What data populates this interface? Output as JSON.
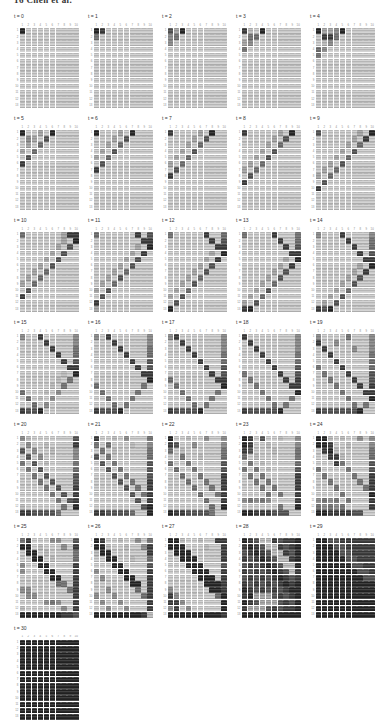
{
  "header": {
    "text": "16 Chen et al."
  },
  "figure": {
    "col_labels": [
      "1",
      "2",
      "3",
      "4",
      "5",
      "6",
      "7",
      "8",
      "9",
      "10"
    ],
    "row_labels": [
      "1",
      "2",
      "3",
      "4",
      "5",
      "6",
      "7",
      "8",
      "9",
      "10",
      "11",
      "12",
      "13"
    ],
    "colormap": {
      "low": "#d4d4d4",
      "high": "#202020"
    },
    "intensity_scale": "digits 0 (light gray, low value) to 9 (near black, high value)",
    "heatmaps": [
      {
        "label": "t = 0",
        "grid": [
          "9111111111",
          "1111111111",
          "1111111111",
          "1111111111",
          "1111111111",
          "1111111111",
          "1111111111",
          "1111111111",
          "1111111111",
          "1111111111",
          "1111111111",
          "1111111111",
          "1111111111"
        ]
      },
      {
        "label": "t = 1",
        "grid": [
          "9811111111",
          "5111111111",
          "1111111111",
          "1111111111",
          "1111111111",
          "1111111111",
          "1111111111",
          "1111111111",
          "1111111111",
          "1111111111",
          "1111111111",
          "1111111111",
          "1111111111"
        ]
      },
      {
        "label": "t = 2",
        "grid": [
          "7391111111",
          "4511111111",
          "4111111111",
          "1111111111",
          "1111111111",
          "1111111111",
          "1111111111",
          "1111111111",
          "1111111111",
          "1111111111",
          "1111111111",
          "1111111111",
          "1111111111"
        ]
      },
      {
        "label": "t = 3",
        "grid": [
          "8219111111",
          "1561111111",
          "3411111111",
          "5111111111",
          "1111111111",
          "1111111111",
          "1111111111",
          "1111111111",
          "1111111111",
          "1111111111",
          "1111111111",
          "1111111111",
          "1111111111"
        ]
      },
      {
        "label": "t = 4",
        "grid": [
          "9334911111",
          "1885111111",
          "1241111111",
          "6411111111",
          "5111111111",
          "1111111111",
          "1111111111",
          "1111111111",
          "1111111111",
          "1111111111",
          "1111111111",
          "1111111111",
          "1111111111"
        ]
      },
      {
        "label": "t = 5",
        "grid": [
          "9113191111",
          "1431711111",
          "1316111111",
          "3161111111",
          "1711111111",
          "8111111111",
          "1111111111",
          "1111111111",
          "1111111111",
          "1111111111",
          "1111111111",
          "1111111111",
          "1111111111"
        ]
      },
      {
        "label": "t = 6",
        "grid": [
          "9111319111",
          "1113171111",
          "1131611111",
          "1317111111",
          "3161111111",
          "1711111111",
          "8111111111",
          "1111111111",
          "1111111111",
          "1111111111",
          "1111111111",
          "1111111111",
          "1111111111"
        ]
      },
      {
        "label": "t = 7",
        "grid": [
          "8111131911",
          "1111317111",
          "1113161111",
          "1131711111",
          "1316111111",
          "3161111111",
          "1711111111",
          "8111111111",
          "1111111111",
          "1111111111",
          "1111111111",
          "1111111111",
          "1111111111"
        ]
      },
      {
        "label": "t = 8",
        "grid": [
          "8111113191",
          "1111131711",
          "1111316111",
          "1113171111",
          "1131711111",
          "1316111111",
          "3161111111",
          "1711111111",
          "8111111111",
          "1111111111",
          "1111111111",
          "1111111111",
          "1111111111"
        ]
      },
      {
        "label": "t = 9",
        "grid": [
          "7111111319",
          "1111113181",
          "1111131611",
          "1111317111",
          "1113161111",
          "1131711111",
          "1316111111",
          "3161111111",
          "1711111111",
          "8111111111",
          "1111111111",
          "1111111111",
          "1111111111"
        ]
      },
      {
        "label": "t = 10",
        "grid": [
          "6111111388",
          "1111111319",
          "1111113171",
          "1111131711",
          "1111317111",
          "1113171111",
          "1131611111",
          "1316111111",
          "3161111111",
          "1711111111",
          "8111111111",
          "1111111111",
          "1111111111"
        ]
      },
      {
        "label": "t = 11",
        "grid": [
          "6111111817",
          "1111111188",
          "1111111319",
          "1111113181",
          "1111131711",
          "1111317111",
          "1113161111",
          "1131711111",
          "1316111111",
          "3171111111",
          "1711111111",
          "8111111111",
          "3111111111"
        ]
      },
      {
        "label": "t = 12",
        "grid": [
          "5111118116",
          "1111111817",
          "1111111188",
          "1111111319",
          "1111113181",
          "1111131711",
          "1111317111",
          "1113161111",
          "1131711111",
          "1316111111",
          "3171111111",
          "1711111111",
          "9111111111"
        ]
      },
      {
        "label": "t = 13",
        "grid": [
          "5111181115",
          "1111118116",
          "1111111817",
          "1111111188",
          "1111111319",
          "1111113181",
          "1111131711",
          "1111317111",
          "1113161111",
          "1131711111",
          "1316111111",
          "3171111111",
          "8911111111"
        ]
      },
      {
        "label": "t = 14",
        "grid": [
          "4111811114",
          "1111181115",
          "1111118116",
          "1111111817",
          "1111111188",
          "1111111319",
          "1111113181",
          "1111131711",
          "1111317111",
          "1113161111",
          "1131711111",
          "1317111111",
          "8791111111"
        ]
      },
      {
        "label": "t = 15",
        "grid": [
          "4118111114",
          "1111811114",
          "1111181115",
          "1111118116",
          "1111111817",
          "1111111188",
          "1111111219",
          "1111112151",
          "1111121511",
          "6111214111",
          "1612141111",
          "1161411111",
          "8779111111"
        ]
      },
      {
        "label": "t = 16",
        "grid": [
          "4181111114",
          "1118111114",
          "1111811115",
          "1111181116",
          "1111118117",
          "1111111817",
          "1111111188",
          "1111111119",
          "6111111151",
          "1611111511",
          "1161115111",
          "1116151111",
          "8777911111"
        ]
      },
      {
        "label": "t = 17",
        "grid": [
          "4811111114",
          "1181111114",
          "1118111114",
          "1111811115",
          "1111181116",
          "1111118117",
          "1111111817",
          "6111111188",
          "1611111119",
          "1161111151",
          "1116111511",
          "1111615111",
          "8777791111"
        ]
      },
      {
        "label": "t = 18",
        "grid": [
          "8111111114",
          "1811111114",
          "1181111114",
          "1118111115",
          "1111811116",
          "1111181117",
          "5111118117",
          "1511111818",
          "1151111188",
          "1115111119",
          "1111511151",
          "1111151511",
          "8777779111"
        ]
      },
      {
        "label": "t = 19",
        "grid": [
          "4111151114",
          "8114111114",
          "1811114114",
          "1181111115",
          "1118111116",
          "5111811116",
          "1511181117",
          "1151118117",
          "1115111818",
          "1111511188",
          "1111151119",
          "1111115151",
          "8777777911"
        ]
      },
      {
        "label": "t = 20",
        "grid": [
          "4211111117",
          "1411211118",
          "7141121114",
          "1714111114",
          "5171211115",
          "1517111116",
          "1151711117",
          "1115171117",
          "1111517118",
          "1111151718",
          "1111115178",
          "2111111519",
          "8877775111"
        ]
      },
      {
        "label": "t = 21",
        "grid": [
          "8112141115",
          "5161112114",
          "1512111115",
          "7151111116",
          "1715111117",
          "1171511117",
          "1117151117",
          "1111715118",
          "1111171518",
          "1111117158",
          "1111111718",
          "1111111179",
          "8877776119"
        ]
      },
      {
        "label": "t = 22",
        "grid": [
          "9112114114",
          "8711411114",
          "6121111115",
          "1151121116",
          "6115111117",
          "1611511117",
          "1161151118",
          "1116115118",
          "1111611518",
          "1111161158",
          "1111116118",
          "1111111619",
          "9887777511"
        ]
      },
      {
        "label": "t = 23",
        "grid": [
          "9817112114",
          "9811211114",
          "8711121115",
          "6121111115",
          "1512111116",
          "5151211117",
          "1515111118",
          "1151511118",
          "1115151118",
          "1111515118",
          "4545411118",
          "1111115119",
          "9988877711"
        ]
      },
      {
        "label": "t = 24",
        "grid": [
          "9921211414",
          "9981121114",
          "1892111115",
          "1188211116",
          "1118511117",
          "5111151117",
          "1511115118",
          "1151111518",
          "1115111158",
          "1111511119",
          "4545151118",
          "5454511118",
          "9988887711"
        ]
      },
      {
        "label": "t = 25",
        "grid": [
          "5811144117",
          "9912111418",
          "1991211115",
          "1199121116",
          "4119911118",
          "4111991118",
          "1111199118",
          "1111116518",
          "4411111158",
          "1441111118",
          "1111454118",
          "2111111418",
          "9999999887"
        ]
      },
      {
        "label": "t = 26",
        "grid": [
          "9811211415",
          "9921121148",
          "2991111118",
          "1199112116",
          "1119911117",
          "4111991118",
          "1411199118",
          "1111119918",
          "1141111618",
          "4114111168",
          "1411411118",
          "1141141118",
          "9999999982"
        ]
      },
      {
        "label": "t = 27",
        "grid": [
          "9921121188",
          "9991112118",
          "1999111118",
          "1199911118",
          "1119991117",
          "1111999118",
          "1111199918",
          "1111119998",
          "4111111998",
          "8411111169",
          "8841111119",
          "4814111119",
          "9999999998"
        ]
      },
      {
        "label": "t = 28",
        "grid": [
          "9872287889",
          "8987228789",
          "7898722879",
          "8789872289",
          "7878987229",
          "8787898728",
          "7878789878",
          "8787878989",
          "9878787899",
          "8933378789",
          "9873337879",
          "8333787889",
          "9999999999"
        ]
      },
      {
        "label": "t = 29",
        "grid": [
          "9977888888",
          "9997788888",
          "9999778888",
          "9999977888",
          "9999997788",
          "9999999778",
          "9999999977",
          "9999999999",
          "9999999999",
          "9999999999",
          "9999999999",
          "9999999999",
          "9999999999"
        ]
      },
      {
        "label": "t = 30",
        "grid": [
          "9999999999",
          "9999999999",
          "9999999999",
          "9999999999",
          "9999999999",
          "9999999999",
          "9999999999",
          "9999999999",
          "9999999999",
          "9999999999",
          "9999999999",
          "9999999999",
          "9999999999"
        ]
      }
    ]
  }
}
